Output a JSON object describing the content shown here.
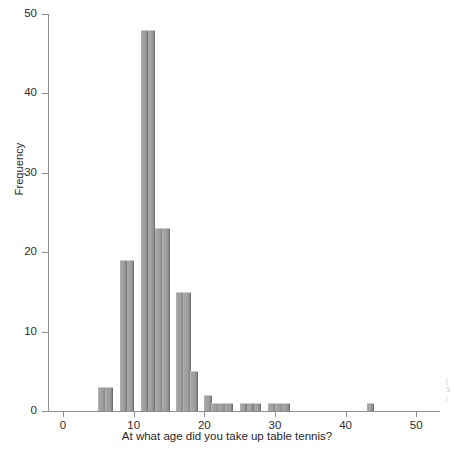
{
  "chart_data": {
    "type": "bar",
    "title": "",
    "subtitle": "",
    "xlabel": "At what age did you take up table tennis?",
    "ylabel": "Frequency",
    "xlim": [
      -3,
      53
    ],
    "ylim": [
      0,
      50
    ],
    "xticks": [
      0,
      10,
      20,
      30,
      40,
      50
    ],
    "yticks": [
      0,
      10,
      20,
      30,
      40,
      50
    ],
    "xtick_labels": [
      "0",
      "10",
      "20",
      "30",
      "40",
      "50"
    ],
    "ytick_labels": [
      "0",
      "10",
      "20",
      "30",
      "40",
      "50"
    ],
    "grid": false,
    "legend": null,
    "bin_width": 1,
    "bar_color": "#9e9e9e",
    "bar_edge_color": "#5c5c5c",
    "background_color": "#ffffff",
    "axis_color": "#8e8e8e",
    "categories": [
      5,
      6,
      7,
      8,
      9,
      10,
      11,
      12,
      13,
      14,
      15,
      16,
      17,
      18,
      19,
      20,
      21,
      22,
      23,
      24,
      25,
      26,
      27,
      28,
      29,
      30,
      31,
      32,
      33,
      34,
      35,
      36,
      37,
      38,
      39,
      40,
      41,
      42,
      43,
      44
    ],
    "values": [
      3,
      3,
      0,
      19,
      19,
      0,
      48,
      48,
      23,
      23,
      0,
      15,
      15,
      5,
      0,
      2,
      1,
      1,
      1,
      0,
      1,
      1,
      1,
      0,
      1,
      1,
      1,
      0,
      0,
      0,
      0,
      0,
      0,
      0,
      1,
      0,
      0,
      0,
      0,
      0
    ],
    "bars": [
      {
        "x": 5,
        "value": 3
      },
      {
        "x": 6,
        "value": 3
      },
      {
        "x": 8,
        "value": 19
      },
      {
        "x": 9,
        "value": 19
      },
      {
        "x": 11,
        "value": 48
      },
      {
        "x": 12,
        "value": 48
      },
      {
        "x": 13,
        "value": 23
      },
      {
        "x": 14,
        "value": 23
      },
      {
        "x": 16,
        "value": 15
      },
      {
        "x": 17,
        "value": 15
      },
      {
        "x": 18,
        "value": 5
      },
      {
        "x": 20,
        "value": 2
      },
      {
        "x": 21,
        "value": 1
      },
      {
        "x": 22,
        "value": 1
      },
      {
        "x": 23,
        "value": 1
      },
      {
        "x": 25,
        "value": 1
      },
      {
        "x": 26,
        "value": 1
      },
      {
        "x": 27,
        "value": 1
      },
      {
        "x": 29,
        "value": 1
      },
      {
        "x": 30,
        "value": 1
      },
      {
        "x": 31,
        "value": 1
      },
      {
        "x": 43,
        "value": 1
      }
    ]
  }
}
